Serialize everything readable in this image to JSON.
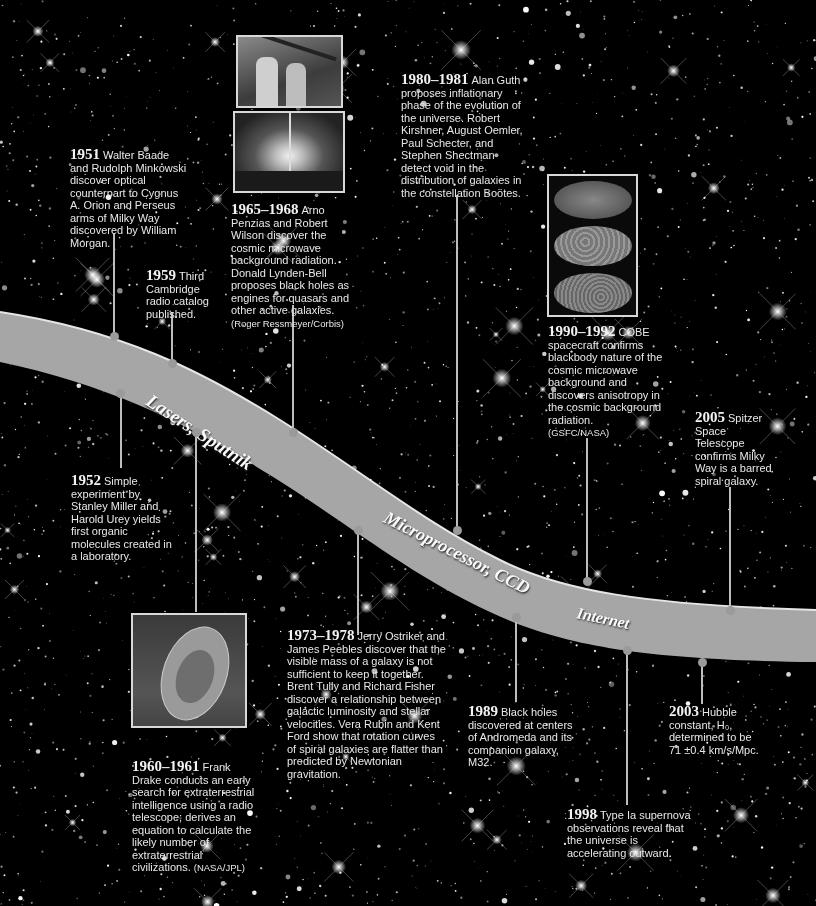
{
  "eras": [
    {
      "label": "Lasers, Sputnik"
    },
    {
      "label": "Microprocessor, CCD"
    },
    {
      "label": "Internet"
    }
  ],
  "events": [
    {
      "year": "1951",
      "text": "Walter Baade and Rudolph Minkowski discover optical counterpart to Cygnus A. Orion and Perseus arms of Milky Way discovered by William Morgan."
    },
    {
      "year": "1952",
      "text": "Simple experiment by Stanley Miller and Harold Urey yields first organic molecules created in a laboratory."
    },
    {
      "year": "1959",
      "text": "Third Cambridge radio catalog published."
    },
    {
      "year": "1960–1961",
      "text": "Frank Drake conducts an early search for extraterrestrial intelligence using a radio telescope; derives an equation to calculate the likely number of extraterrestrial civilizations.",
      "credit": "(NASA/JPL)"
    },
    {
      "year": "1965–1968",
      "text": "Arno Penzias and Robert Wilson discover the cosmic microwave background radiation. Donald Lynden-Bell proposes black holes as engines for quasars and other active galaxies.",
      "credit": "(Roger Ressmeyer/Corbis)"
    },
    {
      "year": "1973–1978",
      "text": "Jerry Ostriker and James Peebles discover that the visible mass of a galaxy is not sufficient to keep it together. Brent Tully and Richard Fisher discover a relationship between galactic luminosity and stellar velocities. Vera Rubin and Kent Ford show that rotation curves of spiral galaxies are flatter than predicted by Newtonian gravitation."
    },
    {
      "year": "1980–1981",
      "text": "Alan Guth proposes inflationary phase of the evolution of the universe. Robert Kirshner, August Oemler, Paul Schecter, and Stephen Shectman detect void in the distribution of galaxies in the constellation Boötes."
    },
    {
      "year": "1989",
      "text": "Black holes discovered at centers of Andromeda and its companion galaxy, M32."
    },
    {
      "year": "1990–1992",
      "text": "COBE spacecraft confirms blackbody nature of the cosmic microwave background and discovers anisotropy in the cosmic background radiation.",
      "credit": "(GSFC/NASA)"
    },
    {
      "year": "1998",
      "text": "Type Ia supernova observations reveal that the universe is accelerating outward."
    },
    {
      "year": "2003",
      "text": "Hubble constant, H₀, determined to be 71 ±0.4 km/s/Mpc."
    },
    {
      "year": "2005",
      "text": "Spitzer Space Telescope confirms Milky Way is a barred spiral galaxy."
    }
  ],
  "photos": {
    "penzias_wilson": "Penzias and Wilson with horn antenna",
    "accretion_diagram": {
      "label_left": "Accretion disk",
      "label_right": "Black hole",
      "label_bottom": "Jet"
    },
    "cobe_maps": "COBE all-sky maps",
    "radio_telescope": "Radio telescope dish"
  },
  "colors": {
    "background": "#000000",
    "band": "#a8a8a8",
    "band_edge": "#e0e0e0",
    "text": "#e8e8e8"
  }
}
